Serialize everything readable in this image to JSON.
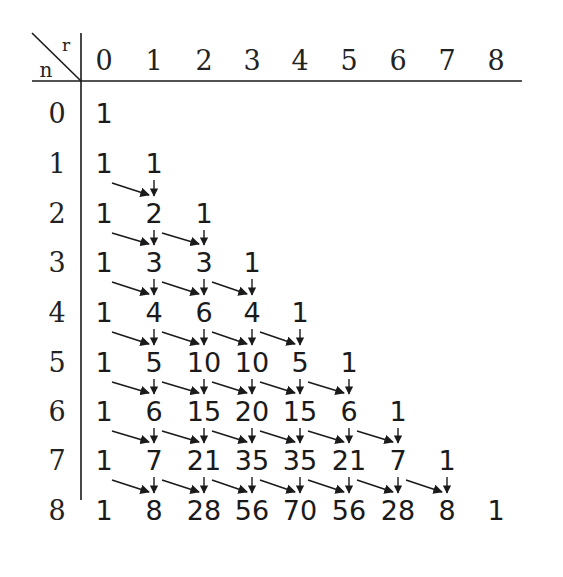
{
  "diagram": {
    "corner": {
      "col_label": "r",
      "row_label": "n"
    },
    "col_headers": [
      "0",
      "1",
      "2",
      "3",
      "4",
      "5",
      "6",
      "7",
      "8"
    ],
    "row_headers": [
      "0",
      "1",
      "2",
      "3",
      "4",
      "5",
      "6",
      "7",
      "8"
    ],
    "rows": [
      [
        "1"
      ],
      [
        "1",
        "1"
      ],
      [
        "1",
        "2",
        "1"
      ],
      [
        "1",
        "3",
        "3",
        "1"
      ],
      [
        "1",
        "4",
        "6",
        "4",
        "1"
      ],
      [
        "1",
        "5",
        "10",
        "10",
        "5",
        "1"
      ],
      [
        "1",
        "6",
        "15",
        "20",
        "15",
        "6",
        "1"
      ],
      [
        "1",
        "7",
        "21",
        "35",
        "35",
        "21",
        "7",
        "1"
      ],
      [
        "1",
        "8",
        "28",
        "56",
        "70",
        "56",
        "28",
        "8",
        "1"
      ]
    ],
    "arrows": {
      "description": "Each entry (n+1, r) for 1<=r<=n receives a diagonal arrow from (n, r-1) and a vertical arrow from (n, r)",
      "color": "#1a1a1a"
    }
  },
  "layout": {
    "col_x": [
      104,
      154,
      204,
      252,
      300,
      349,
      398,
      447,
      496
    ],
    "row_y": [
      113,
      163,
      213,
      262,
      312,
      362,
      411,
      460,
      510
    ],
    "header_y": 60,
    "row_label_x": 57,
    "hline": {
      "x1": 32,
      "x2": 522,
      "y": 81
    },
    "vline": {
      "x": 81,
      "y1": 33,
      "y2": 500
    },
    "diag": {
      "x1": 32,
      "y1": 33,
      "x2": 81,
      "y2": 81
    }
  }
}
